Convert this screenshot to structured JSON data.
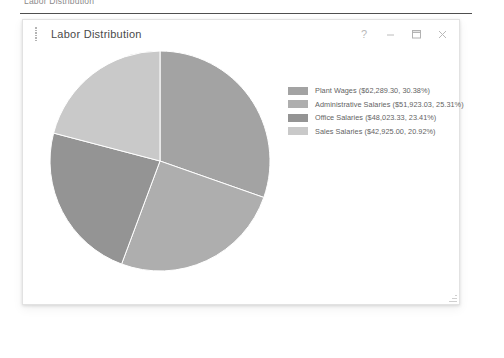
{
  "page": {
    "heading": "Labor Distribution"
  },
  "window": {
    "title": "Labor Distribution",
    "drag_handle_icon": "drag-dots-icon",
    "controls": [
      {
        "name": "help-button",
        "icon": "question-mark-icon",
        "label": "?"
      },
      {
        "name": "minimize-button",
        "icon": "minimize-icon",
        "label": "–"
      },
      {
        "name": "maximize-button",
        "icon": "maximize-icon",
        "label": "□"
      },
      {
        "name": "close-button",
        "icon": "close-icon",
        "label": "×"
      }
    ],
    "resize_grip_icon": "resize-grip-icon"
  },
  "chart_data": {
    "type": "pie",
    "title": "Labor Distribution",
    "start_angle_deg": 0,
    "direction": "clockwise",
    "legend_position": "top-right",
    "grid": false,
    "categories": [
      "Plant Wages",
      "Administrative Salaries",
      "Office Salaries",
      "Sales Salaries"
    ],
    "values": [
      62289.3,
      51923.03,
      48023.33,
      42925.0
    ],
    "percents": [
      30.38,
      25.31,
      23.41,
      20.92
    ],
    "colors": [
      "#a3a3a3",
      "#aeaeae",
      "#949494",
      "#c9c9c9"
    ],
    "currency_symbol": "$",
    "slices": [
      {
        "label": "Plant Wages",
        "value": 62289.3,
        "value_text": "$62,289.30",
        "percent": 30.38,
        "percent_text": "30.38%",
        "color": "#a3a3a3",
        "legend_text": "Plant Wages ($62,289.30, 30.38%)"
      },
      {
        "label": "Administrative Salaries",
        "value": 51923.03,
        "value_text": "$51,923.03",
        "percent": 25.31,
        "percent_text": "25.31%",
        "color": "#aeaeae",
        "legend_text": "Administrative Salaries ($51,923.03, 25.31%)"
      },
      {
        "label": "Office Salaries",
        "value": 48023.33,
        "value_text": "$48,023.33",
        "percent": 23.41,
        "percent_text": "23.41%",
        "color": "#949494",
        "legend_text": "Office Salaries ($48,023.33, 23.41%)"
      },
      {
        "label": "Sales Salaries",
        "value": 42925.0,
        "value_text": "$42,925.00",
        "percent": 20.92,
        "percent_text": "20.92%",
        "color": "#c9c9c9",
        "legend_text": "Sales Salaries ($42,925.00, 20.92%)"
      }
    ]
  }
}
